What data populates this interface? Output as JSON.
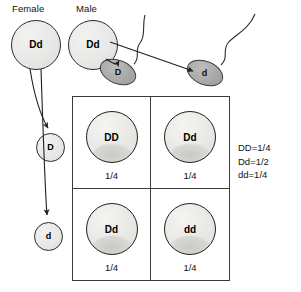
{
  "diagram": {
    "parents": [
      {
        "label": "Female",
        "genotype": "Dd",
        "name": "female-parent"
      },
      {
        "label": "Male",
        "genotype": "Dd",
        "name": "male-parent"
      }
    ],
    "female_gametes": [
      {
        "allele": "D"
      },
      {
        "allele": "d"
      }
    ],
    "male_gametes": [
      {
        "allele": "D",
        "type": "sperm"
      },
      {
        "allele": "d",
        "type": "sperm"
      }
    ],
    "punnett": {
      "cells": [
        {
          "genotype": "DD",
          "fraction": "1/4"
        },
        {
          "genotype": "Dd",
          "fraction": "1/4"
        },
        {
          "genotype": "Dd",
          "fraction": "1/4"
        },
        {
          "genotype": "dd",
          "fraction": "1/4"
        }
      ]
    },
    "legend": [
      "DD=1/4",
      "Dd=1/2",
      "dd=1/4"
    ],
    "colors": {
      "outline": "#3a3a3a",
      "egg_fill": "#e8e8e6",
      "sperm_fill": "#a9a9a7",
      "text": "#111111",
      "background": "#ffffff"
    }
  }
}
